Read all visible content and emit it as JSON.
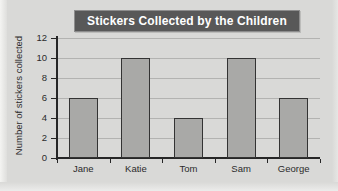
{
  "chart_data": {
    "type": "bar",
    "title": "Stickers Collected by the Children",
    "xlabel": "",
    "ylabel": "Number of stickers collected",
    "categories": [
      "Jane",
      "Katie",
      "Tom",
      "Sam",
      "George"
    ],
    "values": [
      6,
      10,
      4,
      10,
      6
    ],
    "yticks": [
      "0",
      "2",
      "4",
      "6",
      "8",
      "10",
      "12"
    ],
    "ylim": [
      0,
      12
    ],
    "grid": true,
    "legend": "none",
    "colors": {
      "bar_fill": "#a9a9a7",
      "bar_border": "#333333",
      "title_bar": "#585858",
      "title_text": "#ffffff",
      "background": "#d9d9d7",
      "gridline": "#b3b3b1",
      "axis": "#262626",
      "tick_text": "#2b2b2b"
    }
  }
}
